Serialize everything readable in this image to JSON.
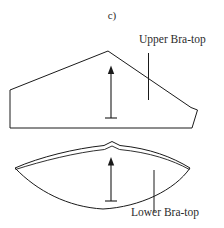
{
  "figure": {
    "caption": "c)",
    "background_color": "#ffffff",
    "stroke_color": "#1a1a1a",
    "text_color": "#2b2b2b",
    "width": 224,
    "height": 228
  },
  "annotations": {
    "upper": {
      "label": "Upper Bra-top",
      "leader_line": "vertical-leader-line"
    },
    "lower": {
      "label": "Lower Bra-top",
      "leader_line": "vertical-leader-line"
    }
  },
  "shapes": {
    "upper_panel": {
      "name": "upper-bra-top-pattern",
      "description": "angular panel with peaked apex, flat base and stepped right edge",
      "outline_points": "10,90 108,51 191,108 197,110 192,128 10,128",
      "grain_arrow": {
        "name": "grain-line-arrow",
        "x": 111,
        "y_top": 67,
        "y_bottom": 118
      }
    },
    "lower_panel": {
      "name": "lower-bra-top-pattern",
      "description": "lens shaped panel with small centre peak, convex upper arc and concave lower arc",
      "left_tip": "15,168",
      "right_tip": "190,168",
      "peak": "112,142",
      "bottom_dip": "103,209",
      "grain_arrow": {
        "name": "grain-line-arrow",
        "x": 111,
        "y_top": 158,
        "y_bottom": 201
      }
    }
  }
}
